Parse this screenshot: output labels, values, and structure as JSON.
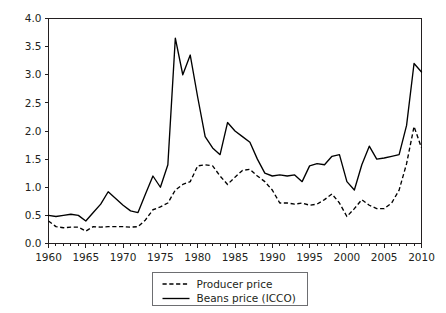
{
  "chart_data": {
    "type": "line",
    "title": "",
    "xlabel": "",
    "ylabel": "",
    "xlim": [
      1960,
      2010
    ],
    "ylim": [
      0.0,
      4.0
    ],
    "grid": false,
    "legend_position": "bottom-center",
    "y_ticks": [
      "0.0",
      "0.5",
      "1.0",
      "1.5",
      "2.0",
      "2.5",
      "3.0",
      "3.5",
      "4.0"
    ],
    "y_tick_values": [
      0.0,
      0.5,
      1.0,
      1.5,
      2.0,
      2.5,
      3.0,
      3.5,
      4.0
    ],
    "x_ticks": [
      "1960",
      "1965",
      "1970",
      "1975",
      "1980",
      "1985",
      "1990",
      "1995",
      "2000",
      "2005",
      "2010"
    ],
    "x_tick_values": [
      1960,
      1965,
      1970,
      1975,
      1980,
      1985,
      1990,
      1995,
      2000,
      2005,
      2010
    ],
    "x_minor_step": 1,
    "x": [
      1960,
      1961,
      1962,
      1963,
      1964,
      1965,
      1966,
      1967,
      1968,
      1969,
      1970,
      1971,
      1972,
      1973,
      1974,
      1975,
      1976,
      1977,
      1978,
      1979,
      1980,
      1981,
      1982,
      1983,
      1984,
      1985,
      1986,
      1987,
      1988,
      1989,
      1990,
      1991,
      1992,
      1993,
      1994,
      1995,
      1996,
      1997,
      1998,
      1999,
      2000,
      2001,
      2002,
      2003,
      2004,
      2005,
      2006,
      2007,
      2008,
      2009,
      2010
    ],
    "series": [
      {
        "name": "Producer price",
        "style": "dashed",
        "color": "#000000",
        "values": [
          0.4,
          0.3,
          0.28,
          0.29,
          0.29,
          0.22,
          0.3,
          0.29,
          0.3,
          0.3,
          0.3,
          0.29,
          0.3,
          0.42,
          0.6,
          0.65,
          0.72,
          0.95,
          1.05,
          1.1,
          1.38,
          1.4,
          1.38,
          1.2,
          1.05,
          1.18,
          1.3,
          1.32,
          1.2,
          1.1,
          0.95,
          0.72,
          0.72,
          0.7,
          0.72,
          0.68,
          0.7,
          0.78,
          0.88,
          0.72,
          0.48,
          0.62,
          0.78,
          0.68,
          0.62,
          0.62,
          0.72,
          0.95,
          1.42,
          2.08,
          1.7
        ]
      },
      {
        "name": "Beans price (ICCO)",
        "style": "solid",
        "color": "#000000",
        "values": [
          0.5,
          0.48,
          0.5,
          0.52,
          0.5,
          0.4,
          0.55,
          0.7,
          0.92,
          0.8,
          0.68,
          0.58,
          0.55,
          0.88,
          1.2,
          1.0,
          1.4,
          3.65,
          3.0,
          3.35,
          2.6,
          1.9,
          1.7,
          1.58,
          2.15,
          2.0,
          1.9,
          1.8,
          1.5,
          1.25,
          1.2,
          1.22,
          1.2,
          1.22,
          1.1,
          1.38,
          1.42,
          1.4,
          1.55,
          1.58,
          1.1,
          0.95,
          1.4,
          1.73,
          1.5,
          1.52,
          1.55,
          1.58,
          2.1,
          3.2,
          3.05
        ]
      }
    ]
  },
  "legend": {
    "entries": [
      {
        "label": "Producer price",
        "marker": "dashed-line-swatch"
      },
      {
        "label": "Beans price (ICCO)",
        "marker": "solid-line-swatch"
      }
    ]
  }
}
